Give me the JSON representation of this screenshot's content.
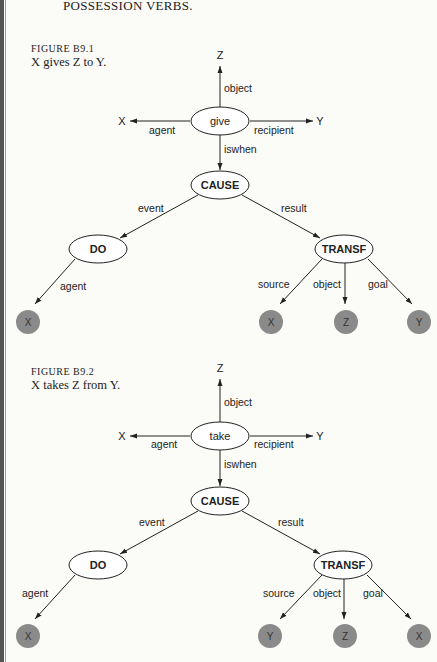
{
  "heading": "POSSESSION VERBS.",
  "figures": [
    {
      "number": "FIGURE B9.1",
      "caption": "X gives Z to Y.",
      "root": "give",
      "top": "Z",
      "left": "X",
      "right": "Y",
      "edges": {
        "object": "object",
        "agent": "agent",
        "recipient": "recipient",
        "iswhen": "iswhen",
        "event": "event",
        "result": "result",
        "do_agent": "agent",
        "source": "source",
        "t_object": "object",
        "goal": "goal"
      },
      "cause": "CAUSE",
      "do": "DO",
      "transf": "TRANSF",
      "leaves": {
        "do_agent": "X",
        "source": "X",
        "object": "Z",
        "goal": "Y"
      }
    },
    {
      "number": "FIGURE B9.2",
      "caption": "X takes Z from Y.",
      "root": "take",
      "top": "Z",
      "left": "X",
      "right": "Y",
      "edges": {
        "object": "object",
        "agent": "agent",
        "recipient": "recipient",
        "iswhen": "iswhen",
        "event": "event",
        "result": "result",
        "do_agent": "agent",
        "source": "source",
        "t_object": "object",
        "goal": "goal"
      },
      "cause": "CAUSE",
      "do": "DO",
      "transf": "TRANSF",
      "leaves": {
        "do_agent": "X",
        "source": "Y",
        "object": "Z",
        "goal": "X"
      }
    }
  ],
  "colors": {
    "line": "#222222",
    "leaf_fill": "#8a8a8a",
    "background": "#fbfbf8"
  }
}
